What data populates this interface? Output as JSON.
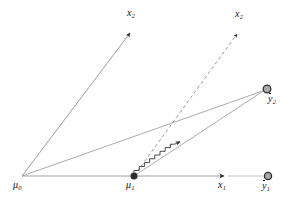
{
  "figure": {
    "type": "vector-geometry-diagram",
    "background_color": "#ffffff",
    "line_color": "#9a9a9a",
    "dark_color": "#1a1a1a",
    "labels": {
      "mu0": "μ",
      "mu0_sub": "0",
      "mu1": "μ",
      "mu1_sub": "1",
      "x1": "x",
      "x1_sub": "1",
      "x2_left": "x",
      "x2_left_sub": "2",
      "x2_right": "x",
      "x2_right_sub": "2",
      "ybar1": "y",
      "ybar1_sub": "1",
      "ybar2": "y",
      "ybar2_sub": "2"
    },
    "points": {
      "mu0": {
        "x": 22,
        "y": 176,
        "marker": "vertex"
      },
      "mu1": {
        "x": 134,
        "y": 176,
        "marker": "filled-dot"
      },
      "ybar1": {
        "x": 268,
        "y": 176,
        "marker": "ring-dot"
      },
      "ybar2": {
        "x": 267,
        "y": 89,
        "marker": "ring-dot"
      }
    },
    "axes": [
      {
        "name": "x1-axis",
        "from": [
          22,
          176
        ],
        "to": [
          225,
          176
        ],
        "style": "solid",
        "arrow": true
      },
      {
        "name": "x2-axis-left",
        "from": [
          22,
          176
        ],
        "to": [
          131,
          31
        ],
        "style": "solid",
        "arrow": true
      },
      {
        "name": "x2-axis-right",
        "from": [
          134,
          176
        ],
        "to": [
          238,
          32
        ],
        "style": "dashed",
        "arrow": true
      }
    ],
    "connectors": [
      {
        "name": "mu0-to-ybar2",
        "from": [
          22,
          176
        ],
        "to": [
          267,
          89
        ],
        "style": "solid",
        "arrow": false
      },
      {
        "name": "mu1-to-ybar2",
        "from": [
          134,
          176
        ],
        "to": [
          267,
          89
        ],
        "style": "solid",
        "arrow": false
      },
      {
        "name": "x1-tail-to-ybar1",
        "from": [
          225,
          176
        ],
        "to": [
          262,
          176
        ],
        "style": "solid",
        "arrow": false
      }
    ],
    "zigzag": {
      "name": "staircase-path",
      "from": [
        134,
        176
      ],
      "to": [
        180,
        144
      ],
      "steps": 9,
      "style": "solid",
      "arrow": true,
      "color": "#3a3a3a"
    }
  }
}
